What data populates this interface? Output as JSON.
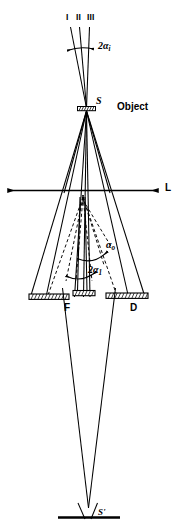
{
  "figure": {
    "kind": "optical-ray-diagram",
    "caption_text": "",
    "stroke_color": "#000000",
    "background_color": "#ffffff",
    "labels": {
      "beam_one": "I",
      "beam_two": "II",
      "beam_three": "III",
      "illumination_aperture": "2α",
      "illumination_aperture_sub": "i",
      "source_point": "S",
      "object": "Object",
      "optic_axis_line": "L",
      "collection_semi_angle": "α",
      "collection_semi_angle_sub": "o",
      "objective_aperture_angle": "2α",
      "objective_aperture_angle_sub": "1",
      "focal_plane_stop": "F",
      "diaphragm": "D",
      "image_point": "S'"
    },
    "elements": [
      {
        "name": "incident-beam-I",
        "type": "ray-line",
        "label": "I"
      },
      {
        "name": "incident-beam-II",
        "type": "ray-line",
        "label": "II"
      },
      {
        "name": "incident-beam-III",
        "type": "ray-line",
        "label": "III"
      },
      {
        "name": "illumination-angle-arc",
        "type": "double-arrow-arc",
        "label": "2αi"
      },
      {
        "name": "specimen-object",
        "type": "hatched-bar",
        "label": "Object"
      },
      {
        "name": "scattered-ray-fan",
        "type": "ray-fan",
        "label": ""
      },
      {
        "name": "optic-axis",
        "type": "double-arrow-line",
        "label": "L"
      },
      {
        "name": "virtual-ray-fan-dashed",
        "type": "dashed-ray-fan",
        "label": ""
      },
      {
        "name": "alpha-o-arc",
        "type": "arc-arrow",
        "label": "αo"
      },
      {
        "name": "alpha-1-arc",
        "type": "double-arrow-arc",
        "label": "2α1"
      },
      {
        "name": "aperture-stop-left",
        "type": "hatched-bar",
        "label": "F"
      },
      {
        "name": "aperture-stop-center",
        "type": "hatched-bar",
        "label": ""
      },
      {
        "name": "aperture-stop-right",
        "type": "hatched-bar",
        "label": "D"
      },
      {
        "name": "convergent-cone",
        "type": "ray-cone",
        "label": ""
      },
      {
        "name": "image-plane",
        "type": "solid-bar",
        "label": "S'"
      }
    ]
  }
}
